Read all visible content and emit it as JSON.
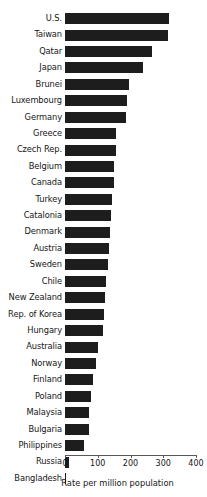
{
  "chart_data": {
    "type": "bar",
    "orientation": "horizontal",
    "title": "",
    "xlabel": "Rate per million population",
    "ylabel": "",
    "xlim": [
      0,
      400
    ],
    "xticks": [
      0,
      100,
      200,
      300,
      400
    ],
    "xtick_labels": [
      "0",
      "100",
      "200",
      "300",
      "400"
    ],
    "grid": false,
    "legend": null,
    "bar_color": "#1d1d1d",
    "axis_color": "#55595c",
    "categories": [
      "U.S.",
      "Taiwan",
      "Qatar",
      "Japan",
      "Brunei",
      "Luxembourg",
      "Germany",
      "Greece",
      "Czech Rep.",
      "Belgium",
      "Canada",
      "Turkey",
      "Catalonia",
      "Denmark",
      "Austria",
      "Sweden",
      "Chile",
      "New Zealand",
      "Rep. of Korea",
      "Hungary",
      "Australia",
      "Norway",
      "Finland",
      "Poland",
      "Malaysia",
      "Bulgaria",
      "Philippines",
      "Russia",
      "Bangladesh"
    ],
    "values": [
      318,
      315,
      266,
      238,
      195,
      189,
      186,
      156,
      155,
      150,
      149,
      143,
      140,
      137,
      134,
      131,
      125,
      122,
      119,
      116,
      101,
      95,
      85,
      80,
      73,
      73,
      58,
      12,
      4
    ]
  }
}
